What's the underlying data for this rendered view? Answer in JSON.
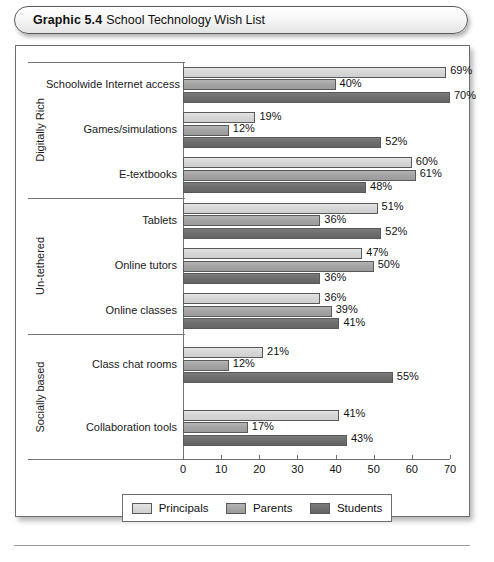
{
  "figure": {
    "label": "Graphic 5.4",
    "caption": "School Technology Wish List"
  },
  "legend": {
    "items": [
      {
        "name": "Principals",
        "color": "#d6d6d6"
      },
      {
        "name": "Parents",
        "color": "#a3a3a3"
      },
      {
        "name": "Students",
        "color": "#6c6c6c"
      }
    ]
  },
  "axis": {
    "ticks": [
      "0",
      "10",
      "20",
      "30",
      "40",
      "50",
      "60",
      "70"
    ]
  },
  "groups": [
    {
      "title": "Digitally Rich"
    },
    {
      "title": "Un-tethered"
    },
    {
      "title": "Socially based"
    }
  ],
  "chart_data": {
    "type": "bar",
    "orientation": "horizontal",
    "title": "School Technology Wish List",
    "xlabel": "",
    "ylabel": "",
    "xlim": [
      0,
      70
    ],
    "xticks": [
      0,
      10,
      20,
      30,
      40,
      50,
      60,
      70
    ],
    "grid": false,
    "legend_position": "bottom",
    "value_suffix": "%",
    "group_labels": [
      "Digitally Rich",
      "Un-tethered",
      "Socially based"
    ],
    "categories": [
      "Schoolwide Internet access",
      "Games/simulations",
      "E-textbooks",
      "Tablets",
      "Online tutors",
      "Online classes",
      "Class chat rooms",
      "Collaboration tools"
    ],
    "category_groups": [
      0,
      0,
      0,
      1,
      1,
      1,
      2,
      2
    ],
    "series": [
      {
        "name": "Principals",
        "color": "#d6d6d6",
        "values": [
          69,
          19,
          60,
          51,
          47,
          36,
          21,
          41
        ]
      },
      {
        "name": "Parents",
        "color": "#a3a3a3",
        "values": [
          40,
          12,
          61,
          36,
          50,
          39,
          12,
          17
        ]
      },
      {
        "name": "Students",
        "color": "#6c6c6c",
        "values": [
          70,
          52,
          48,
          52,
          36,
          41,
          55,
          43
        ]
      }
    ],
    "data_labels": [
      {
        "category": "Schoolwide Internet access",
        "Principals": "69%",
        "Parents": "40%",
        "Students": "70%"
      },
      {
        "category": "Games/simulations",
        "Principals": "19%",
        "Parents": "12%",
        "Students": "52%"
      },
      {
        "category": "E-textbooks",
        "Principals": "60%",
        "Parents": "61%",
        "Students": "48%"
      },
      {
        "category": "Tablets",
        "Principals": "51%",
        "Parents": "36%",
        "Students": "52%"
      },
      {
        "category": "Online tutors",
        "Principals": "47%",
        "Parents": "50%",
        "Students": "36%"
      },
      {
        "category": "Online classes",
        "Principals": "36%",
        "Parents": "39%",
        "Students": "41%"
      },
      {
        "category": "Class chat rooms",
        "Principals": "21%",
        "Parents": "12%",
        "Students": "55%"
      },
      {
        "category": "Collaboration tools",
        "Principals": "41%",
        "Parents": "17%",
        "Students": "43%"
      }
    ]
  }
}
